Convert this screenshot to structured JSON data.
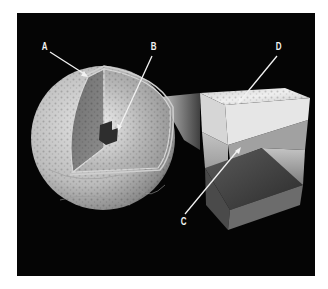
{
  "diagram": {
    "background_color": "#050505",
    "label_color": "#f2f2f2",
    "labels": [
      {
        "id": "A",
        "text": "A",
        "x": 41,
        "y": 42,
        "points_to": "outer ice shell rim of the sphere"
      },
      {
        "id": "B",
        "text": "B",
        "x": 150,
        "y": 42,
        "points_to": "interior mantle layer of the sphere"
      },
      {
        "id": "C",
        "text": "C",
        "x": 180,
        "y": 217,
        "points_to": "liquid/lower layer inside the block"
      },
      {
        "id": "D",
        "text": "D",
        "x": 275,
        "y": 42,
        "points_to": "top icy crust surface of the block"
      }
    ],
    "components": {
      "sphere": {
        "cx": 103,
        "cy": 138,
        "r": 72
      },
      "core": {
        "description": "dark small core at center of cutaway"
      },
      "block": {
        "description": "enlarged cube section showing crust over translucent layer over dark base"
      }
    }
  }
}
